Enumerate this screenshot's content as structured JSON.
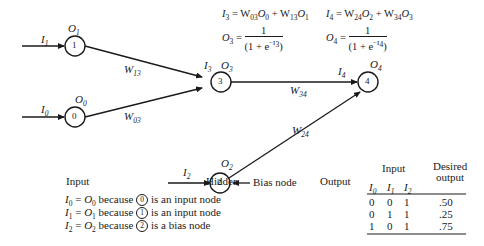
{
  "diagram": {
    "nodes": [
      {
        "id": "1",
        "label": "1",
        "output_label": "O",
        "output_sub": "1",
        "input_label": "I",
        "input_sub": "1"
      },
      {
        "id": "0",
        "label": "0",
        "output_label": "O",
        "output_sub": "0",
        "input_label": "I",
        "input_sub": "0"
      },
      {
        "id": "3",
        "label": "3",
        "output_label": "O",
        "output_sub": "3",
        "input_label": "I",
        "input_sub": "3"
      },
      {
        "id": "4",
        "label": "4",
        "output_label": "O",
        "output_sub": "4",
        "input_label": "I",
        "input_sub": "4"
      },
      {
        "id": "2",
        "label": "2",
        "output_label": "O",
        "output_sub": "2",
        "input_label": "I",
        "input_sub": "2"
      }
    ],
    "edges": [
      {
        "from": "1",
        "to": "3",
        "label": "W",
        "sub": "13"
      },
      {
        "from": "0",
        "to": "3",
        "label": "W",
        "sub": "03"
      },
      {
        "from": "3",
        "to": "4",
        "label": "W",
        "sub": "34"
      },
      {
        "from": "2",
        "to": "4",
        "label": "W",
        "sub": "24"
      }
    ],
    "bias_label": "Bias node",
    "equations": {
      "i3": {
        "lhs": "I",
        "lhs_sub": "3",
        "rhs_a": "W",
        "rhs_a_sub": "03",
        "rhs_b": "O",
        "rhs_b_sub": "0",
        "plus": "+",
        "rhs_c": "W",
        "rhs_c_sub": "13",
        "rhs_d": "O",
        "rhs_d_sub": "1"
      },
      "i4": {
        "lhs": "I",
        "lhs_sub": "4",
        "rhs_a": "W",
        "rhs_a_sub": "24",
        "rhs_b": "O",
        "rhs_b_sub": "2",
        "plus": "+",
        "rhs_c": "W",
        "rhs_c_sub": "34",
        "rhs_d": "O",
        "rhs_d_sub": "3"
      },
      "o3": {
        "lhs": "O",
        "lhs_sub": "3",
        "num": "1",
        "den_pre": "(1 + e",
        "den_exp": "−I",
        "den_exp_sub": "3",
        "den_post": ")"
      },
      "o4": {
        "lhs": "O",
        "lhs_sub": "4",
        "num": "1",
        "den_pre": "(1 + e",
        "den_exp": "−I",
        "den_exp_sub": "4",
        "den_post": ")"
      }
    },
    "layer_labels": {
      "input": "Input",
      "hidden": "Hidden",
      "output": "Output"
    },
    "notes": [
      {
        "lhs": "I",
        "lhs_sub": "0",
        "rhs": "O",
        "rhs_sub": "0",
        "because": "because",
        "node": "0",
        "tail": "is an input node"
      },
      {
        "lhs": "I",
        "lhs_sub": "1",
        "rhs": "O",
        "rhs_sub": "1",
        "because": "because",
        "node": "1",
        "tail": "is an input node"
      },
      {
        "lhs": "I",
        "lhs_sub": "2",
        "rhs": "O",
        "rhs_sub": "2",
        "because": "because",
        "node": "2",
        "tail": "is a bias node"
      }
    ],
    "table": {
      "group_header": "Input",
      "desired_header_line1": "Desired",
      "desired_header_line2": "output",
      "columns": [
        {
          "label": "I",
          "sub": "0"
        },
        {
          "label": "I",
          "sub": "1"
        },
        {
          "label": "I",
          "sub": "2"
        }
      ],
      "rows": [
        {
          "i0": "0",
          "i1": "0",
          "i2": "1",
          "desired": ".50"
        },
        {
          "i0": "0",
          "i1": "1",
          "i2": "1",
          "desired": ".25"
        },
        {
          "i0": "1",
          "i1": "0",
          "i2": "1",
          "desired": ".75"
        }
      ]
    }
  }
}
